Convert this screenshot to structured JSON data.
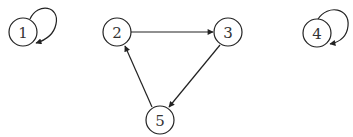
{
  "diagram": {
    "type": "directed-graph",
    "colors": {
      "stroke": "#222222",
      "label": "#333333",
      "background": "#ffffff"
    },
    "nodes": [
      {
        "id": "1",
        "label": "1",
        "x": 23,
        "y": 32
      },
      {
        "id": "2",
        "label": "2",
        "x": 117,
        "y": 32
      },
      {
        "id": "3",
        "label": "3",
        "x": 228,
        "y": 32
      },
      {
        "id": "4",
        "label": "4",
        "x": 317,
        "y": 33
      },
      {
        "id": "5",
        "label": "5",
        "x": 160,
        "y": 120
      }
    ],
    "edges": [
      {
        "from": "1",
        "to": "1",
        "kind": "self-loop"
      },
      {
        "from": "2",
        "to": "3",
        "kind": "straight"
      },
      {
        "from": "3",
        "to": "5",
        "kind": "straight"
      },
      {
        "from": "5",
        "to": "2",
        "kind": "straight"
      },
      {
        "from": "4",
        "to": "4",
        "kind": "self-loop"
      }
    ]
  }
}
